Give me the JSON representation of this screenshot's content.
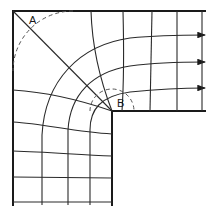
{
  "diagram": {
    "labels": {
      "point_a": "A",
      "point_b": "B"
    },
    "arrows": {
      "count": 3,
      "direction": "right"
    },
    "colors": {
      "line": "#1a1a1a",
      "background": "#ffffff",
      "dashed": "#555555"
    }
  }
}
